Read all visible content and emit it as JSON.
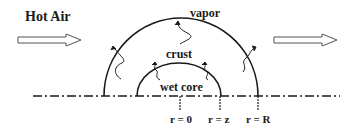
{
  "diagram": {
    "labels": {
      "hot_air": "Hot Air",
      "vapor": "vapor",
      "crust": "crust",
      "wet_core": "wet core",
      "r_zero": "r = 0",
      "r_z": "r = z",
      "r_R": "r = R"
    },
    "colors": {
      "line": "#1a1a1a",
      "background": "#ffffff"
    }
  }
}
